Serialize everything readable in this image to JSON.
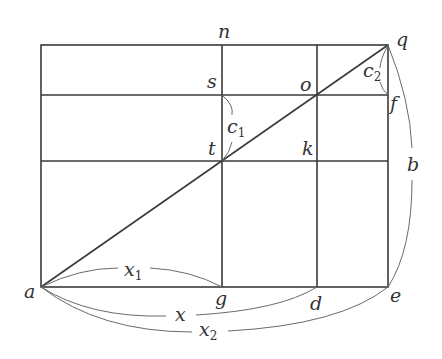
{
  "diagram": {
    "type": "geometric-figure",
    "points": {
      "a": {
        "label": "a",
        "x": 41,
        "y": 287
      },
      "g": {
        "label": "g",
        "x": 222,
        "y": 287
      },
      "d": {
        "label": "d",
        "x": 317,
        "y": 287
      },
      "e": {
        "label": "e",
        "x": 388,
        "y": 287
      },
      "n": {
        "label": "n",
        "x": 222,
        "y": 45
      },
      "q": {
        "label": "q",
        "x": 388,
        "y": 45
      },
      "s": {
        "label": "s",
        "x": 222,
        "y": 95
      },
      "o": {
        "label": "o",
        "x": 317,
        "y": 95
      },
      "f": {
        "label": "f",
        "x": 388,
        "y": 95
      },
      "t": {
        "label": "t",
        "x": 222,
        "y": 161
      },
      "k": {
        "label": "k",
        "x": 317,
        "y": 161
      }
    },
    "labels": {
      "n": "n",
      "q": "q",
      "s": "s",
      "o": "o",
      "f": "f",
      "t": "t",
      "k": "k",
      "a": "a",
      "g": "g",
      "d": "d",
      "e": "e",
      "b": "b",
      "c1_main": "c",
      "c1_sub": "1",
      "c2_main": "c",
      "c2_sub": "2",
      "x1_main": "x",
      "x1_sub": "1",
      "x_main": "x",
      "x2_main": "x",
      "x2_sub": "2"
    },
    "segments": [
      {
        "from": "a",
        "to": "q",
        "kind": "diagonal"
      },
      {
        "from": "a",
        "to": "e",
        "kind": "bottom"
      },
      {
        "from": "top-left",
        "to": "q",
        "kind": "top"
      },
      {
        "from": "top-left",
        "to": "a",
        "kind": "left"
      },
      {
        "from": "q",
        "to": "e",
        "kind": "right"
      },
      {
        "from": "n",
        "to": "g",
        "kind": "vertical"
      },
      {
        "from": "top-d",
        "to": "d",
        "kind": "vertical"
      },
      {
        "from": "left-s",
        "to": "f",
        "kind": "horizontal"
      },
      {
        "from": "left-t",
        "to": "right-k",
        "kind": "horizontal"
      }
    ],
    "measurements": [
      {
        "name": "x1",
        "from": "a",
        "to": "g"
      },
      {
        "name": "x",
        "from": "a",
        "to": "d"
      },
      {
        "name": "x2",
        "from": "a",
        "to": "e"
      },
      {
        "name": "b",
        "from": "q",
        "to": "e"
      },
      {
        "name": "c1",
        "from": "s",
        "to": "t"
      },
      {
        "name": "c2",
        "from": "q",
        "to": "f"
      }
    ],
    "colors": {
      "line": "#3a3a3a",
      "arc": "#6a6a6a",
      "text": "#333333",
      "background": "#ffffff"
    }
  }
}
